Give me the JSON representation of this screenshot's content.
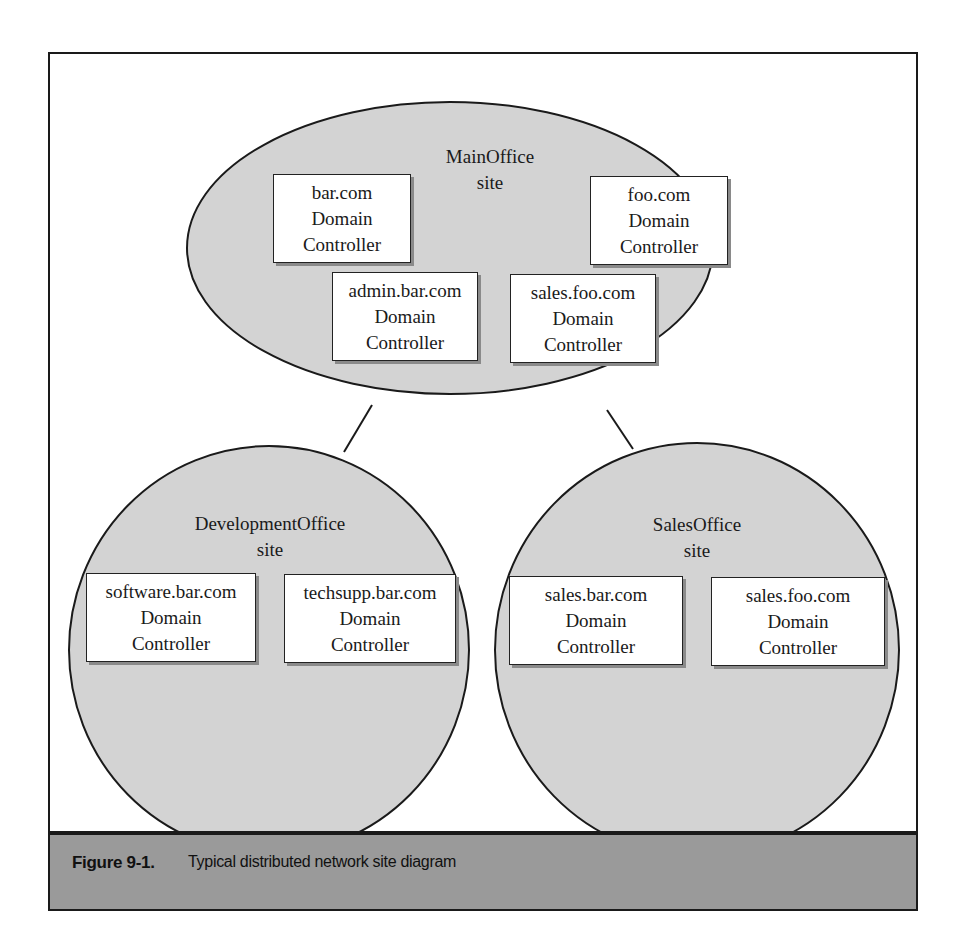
{
  "figure": {
    "number": "Figure 9-1.",
    "caption": "Typical distributed network site diagram"
  },
  "colors": {
    "site_fill": "#d3d3d3",
    "caption_band": "#9a9a9a",
    "outline": "#1a1a1a"
  },
  "sites": [
    {
      "name": "MainOffice",
      "suffix": "site",
      "controllers": [
        {
          "domain": "bar.com",
          "line2": "Domain",
          "line3": "Controller"
        },
        {
          "domain": "foo.com",
          "line2": "Domain",
          "line3": "Controller"
        },
        {
          "domain": "admin.bar.com",
          "line2": "Domain",
          "line3": "Controller"
        },
        {
          "domain": "sales.foo.com",
          "line2": "Domain",
          "line3": "Controller"
        }
      ]
    },
    {
      "name": "DevelopmentOffice",
      "suffix": "site",
      "controllers": [
        {
          "domain": "software.bar.com",
          "line2": "Domain",
          "line3": "Controller"
        },
        {
          "domain": "techsupp.bar.com",
          "line2": "Domain",
          "line3": "Controller"
        }
      ]
    },
    {
      "name": "SalesOffice",
      "suffix": "site",
      "controllers": [
        {
          "domain": "sales.bar.com",
          "line2": "Domain",
          "line3": "Controller"
        },
        {
          "domain": "sales.foo.com",
          "line2": "Domain",
          "line3": "Controller"
        }
      ]
    }
  ],
  "links": [
    {
      "from": "MainOffice",
      "to": "DevelopmentOffice"
    },
    {
      "from": "MainOffice",
      "to": "SalesOffice"
    }
  ]
}
